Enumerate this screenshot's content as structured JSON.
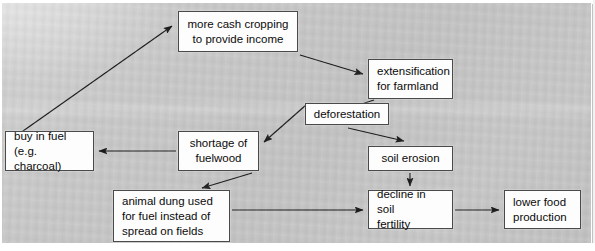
{
  "diagram": {
    "type": "flow-diagram",
    "title": "",
    "background_color": "#c7c7c7",
    "node_fill": "#fdfdfd",
    "node_border": "#4a4a4a",
    "text_color": "#0b0b0b",
    "nodes": [
      {
        "id": "cash_cropping",
        "label": "more cash cropping\nto provide income",
        "x": 178,
        "y": 11,
        "w": 120,
        "h": 41
      },
      {
        "id": "extensification",
        "label": "extensification\nfor farmland",
        "x": 368,
        "y": 59,
        "w": 85,
        "h": 40
      },
      {
        "id": "deforestation",
        "label": "deforestation",
        "x": 305,
        "y": 103,
        "w": 84,
        "h": 22
      },
      {
        "id": "buy_in_fuel",
        "label": "buy in fuel\n(e.g. charcoal)",
        "x": 5,
        "y": 131,
        "w": 89,
        "h": 40
      },
      {
        "id": "shortage",
        "label": "shortage of\nfuelwood",
        "x": 178,
        "y": 131,
        "w": 81,
        "h": 40
      },
      {
        "id": "soil_erosion",
        "label": "soil erosion",
        "x": 368,
        "y": 146,
        "w": 85,
        "h": 25
      },
      {
        "id": "animal_dung",
        "label": "animal dung used\nfor fuel instead of\nspread on fields",
        "x": 113,
        "y": 190,
        "w": 117,
        "h": 52
      },
      {
        "id": "decline_soil",
        "label": "decline in soil\nfertility",
        "x": 368,
        "y": 190,
        "w": 85,
        "h": 39
      },
      {
        "id": "lower_food",
        "label": "lower food\nproduction",
        "x": 504,
        "y": 190,
        "w": 77,
        "h": 39
      }
    ],
    "edges": [
      {
        "id": "e1",
        "from": "buy_in_fuel",
        "to": "cash_cropping",
        "points": "6,143 172,26"
      },
      {
        "id": "e2",
        "from": "cash_cropping",
        "to": "extensification",
        "points": "300,55 363,74"
      },
      {
        "id": "e3",
        "from": "extensification",
        "to": "deforestation",
        "points": "374,100 312,120"
      },
      {
        "id": "e4",
        "from": "deforestation",
        "to": "soil_erosion",
        "points": "348,128 404,141"
      },
      {
        "id": "e5",
        "from": "deforestation",
        "to": "shortage",
        "points": "306,105 264,142"
      },
      {
        "id": "e6",
        "from": "shortage",
        "to": "buy_in_fuel",
        "points": "176,151 99,151"
      },
      {
        "id": "e7",
        "from": "shortage",
        "to": "animal_dung",
        "points": "252,173 202,188"
      },
      {
        "id": "e8",
        "from": "soil_erosion",
        "to": "decline_soil",
        "points": "410,173 410,186"
      },
      {
        "id": "e9",
        "from": "animal_dung",
        "to": "decline_soil",
        "points": "232,210 363,210"
      },
      {
        "id": "e10",
        "from": "decline_soil",
        "to": "lower_food",
        "points": "455,210 499,210"
      }
    ]
  }
}
